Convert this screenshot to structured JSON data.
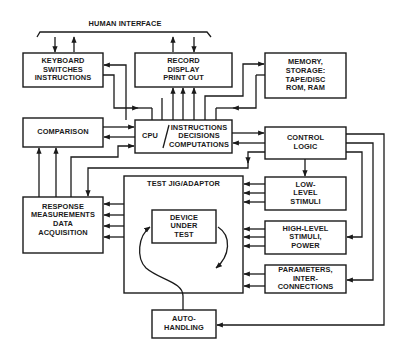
{
  "diagram": {
    "type": "block-diagram",
    "header": {
      "label": "HUMAN INTERFACE"
    },
    "blocks": {
      "keyboard": {
        "lines": [
          "KEYBOARD",
          "SWITCHES",
          "INSTRUCTIONS"
        ]
      },
      "record": {
        "lines": [
          "RECORD",
          "DISPLAY",
          "PRINT OUT"
        ]
      },
      "memory": {
        "lines": [
          "MEMORY,",
          "STORAGE:",
          "TAPE/DISC",
          "ROM, RAM"
        ]
      },
      "comparison": {
        "lines": [
          "COMPARISON"
        ]
      },
      "cpu": {
        "left": "CPU",
        "separator": "/",
        "lines": [
          "INSTRUCTIONS",
          "DECISIONS",
          "COMPUTATIONS"
        ]
      },
      "control_logic": {
        "lines": [
          "CONTROL",
          "LOGIC"
        ]
      },
      "test_jig": {
        "title": "TEST JIG/ADAPTOR"
      },
      "device_under_test": {
        "lines": [
          "DEVICE",
          "UNDER",
          "TEST"
        ]
      },
      "response": {
        "lines": [
          "RESPONSE",
          "MEASUREMENTS",
          "DATA",
          "ACQUISITION"
        ]
      },
      "low_level": {
        "lines": [
          "LOW-",
          "LEVEL",
          "STIMULI"
        ]
      },
      "high_level": {
        "lines": [
          "HIGH-LEVEL",
          "STIMULI,",
          "POWER"
        ]
      },
      "parameters": {
        "lines": [
          "PARAMETERS,",
          "INTER-",
          "CONNECTIONS"
        ]
      },
      "auto_handling": {
        "lines": [
          "AUTO-",
          "HANDLING"
        ]
      }
    },
    "connections": [
      {
        "from": "human_interface",
        "to": "keyboard"
      },
      {
        "from": "keyboard",
        "to": "human_interface"
      },
      {
        "from": "record",
        "to": "human_interface"
      },
      {
        "from": "human_interface",
        "to": "record"
      },
      {
        "from": "cpu",
        "to": "keyboard"
      },
      {
        "from": "keyboard",
        "to": "cpu"
      },
      {
        "from": "cpu",
        "to": "record",
        "count": 3
      },
      {
        "from": "cpu",
        "to": "memory"
      },
      {
        "from": "memory",
        "to": "cpu"
      },
      {
        "from": "comparison",
        "to": "cpu"
      },
      {
        "from": "cpu",
        "to": "comparison"
      },
      {
        "from": "response",
        "to": "cpu"
      },
      {
        "from": "response",
        "to": "comparison",
        "count": 2
      },
      {
        "from": "cpu",
        "to": "control_logic"
      },
      {
        "from": "control_logic",
        "to": "cpu"
      },
      {
        "from": "control_logic",
        "to": "response"
      },
      {
        "from": "control_logic",
        "to": "low_level"
      },
      {
        "from": "control_logic",
        "to": "high_level"
      },
      {
        "from": "control_logic",
        "to": "parameters"
      },
      {
        "from": "control_logic",
        "to": "auto_handling"
      },
      {
        "from": "test_jig",
        "to": "response",
        "count": 4
      },
      {
        "from": "low_level",
        "to": "test_jig",
        "count": 3
      },
      {
        "from": "high_level",
        "to": "test_jig",
        "count": 3
      },
      {
        "from": "parameters",
        "to": "test_jig",
        "count": 2
      },
      {
        "from": "auto_handling",
        "to": "device_under_test"
      }
    ]
  }
}
